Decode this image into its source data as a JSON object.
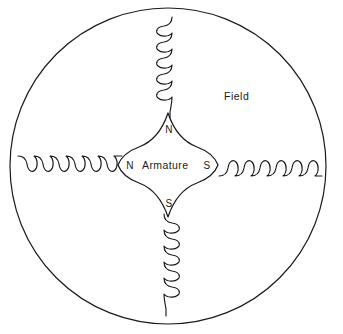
{
  "diagram": {
    "background_color": "#ffffff",
    "ink_color": "#1a1a1a",
    "labels": {
      "field": "Field",
      "armature": "Armature",
      "pole_north_top": "N",
      "pole_south_bottom": "S",
      "pole_north_left": "N",
      "pole_south_right": "S"
    },
    "frame": {
      "shape": "circle",
      "center_x": 168,
      "center_y": 166,
      "radius": 158
    },
    "armature": {
      "shape": "four-pointed-star",
      "center_x": 168,
      "center_y": 165,
      "point_reach": 52,
      "waist": 30
    },
    "coils": [
      {
        "name": "top-field-coil",
        "orientation": "vertical",
        "loops": 6,
        "loop_side": "left"
      },
      {
        "name": "bottom-field-coil",
        "orientation": "vertical",
        "loops": 6,
        "loop_side": "right"
      },
      {
        "name": "left-field-coil",
        "orientation": "horizontal",
        "loops": 6,
        "loop_side": "below"
      },
      {
        "name": "right-field-coil",
        "orientation": "horizontal",
        "loops": 6,
        "loop_side": "above"
      }
    ]
  }
}
